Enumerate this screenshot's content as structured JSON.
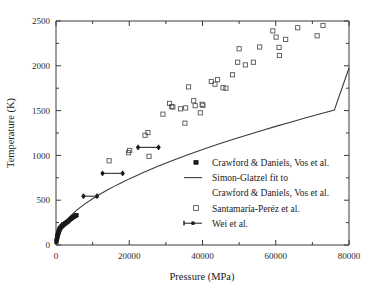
{
  "chart_data": {
    "type": "scatter",
    "title": "",
    "xlabel": "Pressure (MPa)",
    "ylabel": "Temperature (K)",
    "xlim": [
      0,
      80000
    ],
    "ylim": [
      0,
      2500
    ],
    "xticks": [
      0,
      20000,
      40000,
      60000,
      80000
    ],
    "xtick_labels": [
      "0",
      "20000",
      "40000",
      "60000",
      "80000"
    ],
    "xminor_ticks": [
      10000,
      30000,
      50000,
      70000
    ],
    "yticks": [
      0,
      500,
      1000,
      1500,
      2000,
      2500
    ],
    "ytick_labels": [
      "0",
      "500",
      "1000",
      "1500",
      "2000",
      "2500"
    ],
    "yminor_ticks": [
      250,
      750,
      1250,
      1750,
      2250
    ],
    "grid": false,
    "legend_position": "center-right-inside",
    "series": [
      {
        "name": "Crawford & Daniels, Vos et al.",
        "marker": "filled-square",
        "points": [
          [
            120,
            35
          ],
          [
            200,
            55
          ],
          [
            260,
            70
          ],
          [
            330,
            85
          ],
          [
            400,
            98
          ],
          [
            470,
            110
          ],
          [
            540,
            122
          ],
          [
            620,
            133
          ],
          [
            700,
            143
          ],
          [
            780,
            152
          ],
          [
            880,
            162
          ],
          [
            980,
            172
          ],
          [
            1100,
            182
          ],
          [
            1250,
            192
          ],
          [
            1400,
            200
          ],
          [
            1560,
            208
          ],
          [
            1720,
            215
          ],
          [
            1900,
            221
          ],
          [
            2100,
            228
          ],
          [
            2300,
            234
          ],
          [
            2500,
            240
          ],
          [
            2750,
            248
          ],
          [
            3000,
            255
          ],
          [
            3250,
            262
          ],
          [
            3500,
            270
          ],
          [
            3800,
            282
          ],
          [
            4100,
            292
          ],
          [
            4350,
            300
          ],
          [
            4600,
            308
          ],
          [
            4900,
            316
          ],
          [
            5150,
            322
          ],
          [
            5400,
            328
          ],
          [
            5600,
            333
          ]
        ]
      },
      {
        "name": "Simon-Glatzel fit to Crawford & Daniels, Vos et al.",
        "marker": "line",
        "points": [
          [
            0,
            0
          ],
          [
            1000,
            150
          ],
          [
            2000,
            225
          ],
          [
            3000,
            280
          ],
          [
            4000,
            325
          ],
          [
            5000,
            365
          ],
          [
            6000,
            400
          ],
          [
            8000,
            462
          ],
          [
            10000,
            517
          ],
          [
            12000,
            567
          ],
          [
            14000,
            613
          ],
          [
            16000,
            657
          ],
          [
            18000,
            698
          ],
          [
            20000,
            738
          ],
          [
            24000,
            812
          ],
          [
            28000,
            881
          ],
          [
            32000,
            946
          ],
          [
            36000,
            1007
          ],
          [
            40000,
            1065
          ],
          [
            44000,
            1121
          ],
          [
            48000,
            1174
          ],
          [
            52000,
            1226
          ],
          [
            56000,
            1276
          ],
          [
            60000,
            1324
          ],
          [
            64000,
            1371
          ],
          [
            68000,
            1417
          ],
          [
            72000,
            1461
          ],
          [
            76000,
            1505
          ],
          [
            80000,
            1975
          ]
        ]
      },
      {
        "name": "Santamaría-Peréz et al.",
        "marker": "open-square",
        "points": [
          [
            14500,
            940
          ],
          [
            19800,
            1030
          ],
          [
            20100,
            1055
          ],
          [
            24300,
            1225
          ],
          [
            25100,
            1255
          ],
          [
            25400,
            990
          ],
          [
            29200,
            1460
          ],
          [
            31000,
            1580
          ],
          [
            31600,
            1545
          ],
          [
            31900,
            1540
          ],
          [
            34000,
            1520
          ],
          [
            35200,
            1360
          ],
          [
            35400,
            1530
          ],
          [
            36200,
            1765
          ],
          [
            37600,
            1610
          ],
          [
            38000,
            1555
          ],
          [
            39400,
            1475
          ],
          [
            39900,
            1570
          ],
          [
            40100,
            1560
          ],
          [
            42400,
            1825
          ],
          [
            43400,
            1795
          ],
          [
            44100,
            1845
          ],
          [
            45600,
            1755
          ],
          [
            46400,
            1750
          ],
          [
            48200,
            1900
          ],
          [
            49600,
            2040
          ],
          [
            50000,
            2190
          ],
          [
            51700,
            2010
          ],
          [
            53900,
            2040
          ],
          [
            55600,
            2210
          ],
          [
            59200,
            2390
          ],
          [
            60100,
            2320
          ],
          [
            60900,
            2205
          ],
          [
            61000,
            2115
          ],
          [
            62700,
            2295
          ],
          [
            66000,
            2425
          ],
          [
            71300,
            2335
          ],
          [
            72900,
            2450
          ]
        ]
      },
      {
        "name": "Wei et al.",
        "marker": "line-filled-circle-with-xerror",
        "points": [
          {
            "x": 7500,
            "y": 545,
            "xerr_low": 7500,
            "xerr_high": 11200
          },
          {
            "x": 12700,
            "y": 800,
            "xerr_low": 12700,
            "xerr_high": 18200
          },
          {
            "x": 22400,
            "y": 1090,
            "xerr_low": 22400,
            "xerr_high": 28000
          }
        ]
      }
    ]
  },
  "legend": {
    "entries": [
      {
        "label": "Crawford & Daniels, Vos et al.",
        "marker": "filled-square"
      },
      {
        "label": "Simon-Glatzel fit to",
        "marker": "line"
      },
      {
        "label": "Crawford & Daniels, Vos et al.",
        "marker": "none"
      },
      {
        "label": "Santamaría-Peréz et al.",
        "marker": "open-square"
      },
      {
        "label": "Wei et al.",
        "marker": "line-filled-circle"
      }
    ]
  },
  "colors": {
    "axis": "#3a3a3a",
    "filled_marker": "#1a1a1a",
    "open_marker": "#555555",
    "curve": "#3a3a3a",
    "background": "#ffffff"
  }
}
